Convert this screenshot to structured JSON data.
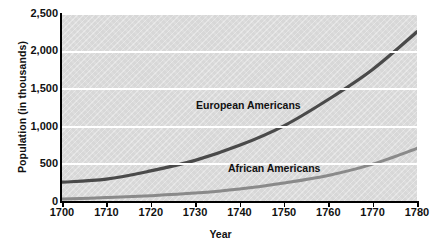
{
  "chart_data": {
    "type": "line",
    "title": "",
    "xlabel": "Year",
    "ylabel": "Population (in thousands)",
    "xlim": [
      1700,
      1780
    ],
    "ylim": [
      0,
      2500
    ],
    "grid": "horizontal",
    "legend_position": "inline-annotation",
    "x_ticks": [
      "1700",
      "1710",
      "1720",
      "1730",
      "1740",
      "1750",
      "1760",
      "1770",
      "1780"
    ],
    "y_ticks": [
      "0",
      "500",
      "1,000",
      "1,500",
      "2,000",
      "2,500"
    ],
    "x": [
      1700,
      1710,
      1720,
      1730,
      1740,
      1750,
      1760,
      1770,
      1780
    ],
    "series": [
      {
        "name": "European Americans",
        "color": "#4a4a4a",
        "values": [
          250,
          290,
          400,
          540,
          740,
          1000,
          1350,
          1750,
          2250
        ]
      },
      {
        "name": "African Americans",
        "color": "#8a8a8a",
        "values": [
          25,
          45,
          70,
          105,
          160,
          240,
          340,
          490,
          700
        ]
      }
    ]
  },
  "axis": {
    "y_title": "Population (in thousands)",
    "x_title": "Year",
    "y_tick_labels": [
      "2,500",
      "2,000",
      "1,500",
      "1,000",
      "500",
      "0"
    ],
    "x_tick_labels": [
      "1700",
      "1710",
      "1720",
      "1730",
      "1740",
      "1750",
      "1760",
      "1770",
      "1780"
    ]
  },
  "annotations": {
    "european_label": "European Americans",
    "african_label": "African Americans"
  },
  "colors": {
    "plot_background": "#dddddd",
    "gridline": "#ffffff",
    "axis": "#000000",
    "european_line": "#4a4a4a",
    "african_line": "#8a8a8a",
    "text": "#111111"
  }
}
